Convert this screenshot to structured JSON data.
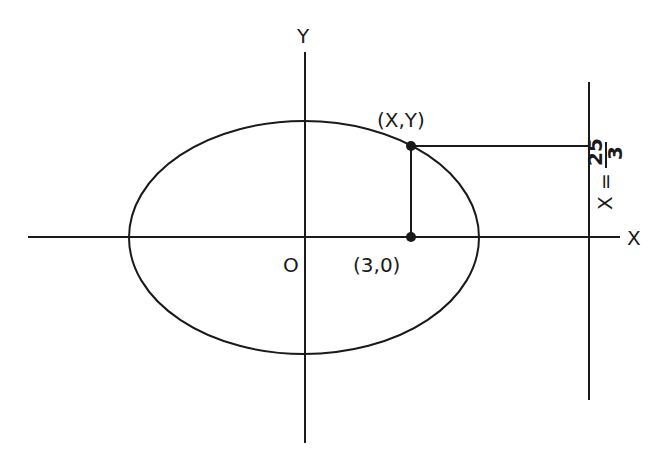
{
  "diagram": {
    "axes": {
      "x_label": "X",
      "y_label": "Y",
      "origin_label": "O"
    },
    "point_on_ellipse": {
      "label": "(X,Y)"
    },
    "focus": {
      "label": "(3,0)"
    },
    "directrix": {
      "lhs": "X =",
      "numerator": "25",
      "denominator": "3"
    },
    "stroke_color": "#1a1a1a"
  }
}
